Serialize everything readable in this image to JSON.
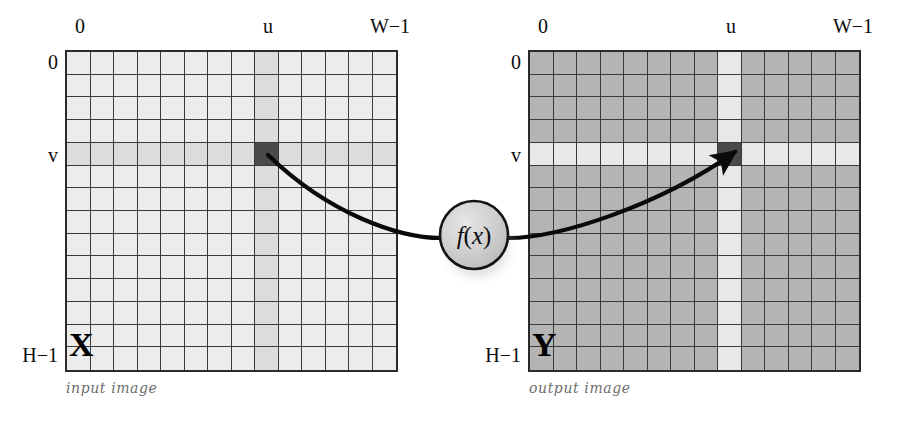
{
  "figure": {
    "type": "diagram"
  },
  "input_panel": {
    "caption": "input image",
    "matrix_letter": "X",
    "top_left_label": "0",
    "top_u_label": "u",
    "top_right_label": "W−1",
    "left_top_label": "0",
    "left_v_label": "v",
    "left_bottom_label": "H−1",
    "grid": {
      "cols": 14,
      "rows": 14,
      "highlight_col_index": 8,
      "highlight_row_index": 4,
      "base_color": "#ececec",
      "highlight_color": "#dcdcdc",
      "marked_cell_color": "#4a4a4a",
      "border_color": "#3a3a3a"
    }
  },
  "output_panel": {
    "caption": "output image",
    "matrix_letter": "Y",
    "top_left_label": "0",
    "top_u_label": "u",
    "top_right_label": "W−1",
    "left_top_label": "0",
    "left_v_label": "v",
    "left_bottom_label": "H−1",
    "grid": {
      "cols": 14,
      "rows": 14,
      "highlight_col_index": 8,
      "highlight_row_index": 4,
      "base_color": "#b4b4b4",
      "highlight_color": "#e8e8e8",
      "marked_cell_color": "#4a4a4a",
      "border_color": "#3a3a3a"
    }
  },
  "mapping": {
    "node_label_f": "f",
    "node_label_open": "(",
    "node_label_x": "x",
    "node_label_close": ")",
    "node_label_full": "f(x)",
    "arrow_color": "#0a0a0a"
  },
  "chart_data": {
    "type": "heatmap",
    "title": "",
    "grids": [
      {
        "name": "input image",
        "symbol": "X",
        "cols": 14,
        "rows": 14,
        "x_axis_labels": [
          "0",
          "u",
          "W−1"
        ],
        "y_axis_labels": [
          "0",
          "v",
          "H−1"
        ],
        "marked_pixel": {
          "col": 8,
          "row": 4
        }
      },
      {
        "name": "output image",
        "symbol": "Y",
        "cols": 14,
        "rows": 14,
        "x_axis_labels": [
          "0",
          "u",
          "W−1"
        ],
        "y_axis_labels": [
          "0",
          "v",
          "H−1"
        ],
        "marked_pixel": {
          "col": 8,
          "row": 4
        }
      }
    ]
  }
}
